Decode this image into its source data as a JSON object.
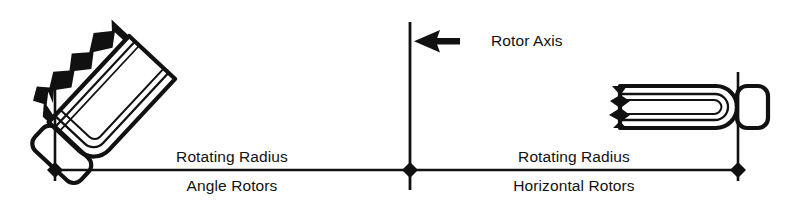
{
  "diagram": {
    "background_color": "#ffffff",
    "line_color": "#111111",
    "labels": {
      "rotor_axis": "Rotor Axis",
      "rotating_radius_left": "Rotating Radius",
      "rotating_radius_right": "Rotating Radius",
      "angle_rotors": "Angle Rotors",
      "horizontal_rotors": "Horizontal Rotors"
    },
    "icons": {
      "arrow": "left-arrow-icon",
      "axis": "rotor-axis-line-icon",
      "angle_tube": "angle-rotor-tube-icon",
      "horizontal_tube": "horizontal-rotor-tube-icon",
      "marker": "diamond-marker-icon"
    },
    "geometry": {
      "baseline_y": 170,
      "left_marker_x": 55,
      "center_marker_x": 410,
      "right_marker_x": 738,
      "axis_line_top": 22,
      "axis_line_bottom": 190
    }
  }
}
